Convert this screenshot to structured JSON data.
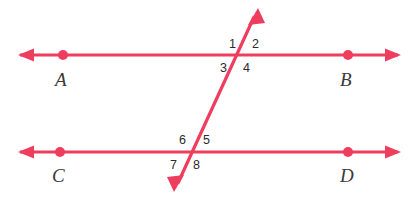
{
  "figure": {
    "background_color": "#ffffff",
    "line_color": "#ef3d5e",
    "label_color": "#2b2b2b",
    "point_label_color": "#3a3a3a"
  },
  "lines": [
    {
      "id": "line-ab",
      "name": "line-ab",
      "orientation": "horizontal",
      "y": 55,
      "x_start": 18,
      "x_end": 400,
      "arrow_start": true,
      "arrow_end": true
    },
    {
      "id": "line-cd",
      "name": "line-cd",
      "orientation": "horizontal",
      "y": 152,
      "x_start": 18,
      "x_end": 400,
      "arrow_start": true,
      "arrow_end": true
    },
    {
      "id": "transversal",
      "name": "transversal-line",
      "orientation": "oblique",
      "x_start": 258,
      "y_start": 8,
      "x_end": 174,
      "y_end": 192,
      "arrow_start": true,
      "arrow_end": true
    }
  ],
  "points": [
    {
      "label": "A",
      "dot_x": 63,
      "dot_y": 55,
      "label_x": 55,
      "label_y": 70
    },
    {
      "label": "B",
      "dot_x": 348,
      "dot_y": 55,
      "label_x": 340,
      "label_y": 70
    },
    {
      "label": "C",
      "dot_x": 60,
      "dot_y": 152,
      "label_x": 52,
      "label_y": 166
    },
    {
      "label": "D",
      "dot_x": 348,
      "dot_y": 152,
      "label_x": 340,
      "label_y": 166
    }
  ],
  "intersections": [
    {
      "name": "upper-intersection",
      "x": 240,
      "y": 56
    },
    {
      "name": "lower-intersection",
      "x": 190,
      "y": 153
    }
  ],
  "angles": [
    {
      "label": "1",
      "x": 229,
      "y": 38,
      "position": "upper-left"
    },
    {
      "label": "2",
      "x": 252,
      "y": 38,
      "position": "upper-right"
    },
    {
      "label": "3",
      "x": 220,
      "y": 62,
      "position": "lower-left"
    },
    {
      "label": "4",
      "x": 243,
      "y": 62,
      "position": "lower-right"
    },
    {
      "label": "6",
      "x": 179,
      "y": 134,
      "position": "upper-left"
    },
    {
      "label": "5",
      "x": 203,
      "y": 134,
      "position": "upper-right"
    },
    {
      "label": "7",
      "x": 170,
      "y": 159,
      "position": "lower-left"
    },
    {
      "label": "8",
      "x": 193,
      "y": 159,
      "position": "lower-right"
    }
  ]
}
